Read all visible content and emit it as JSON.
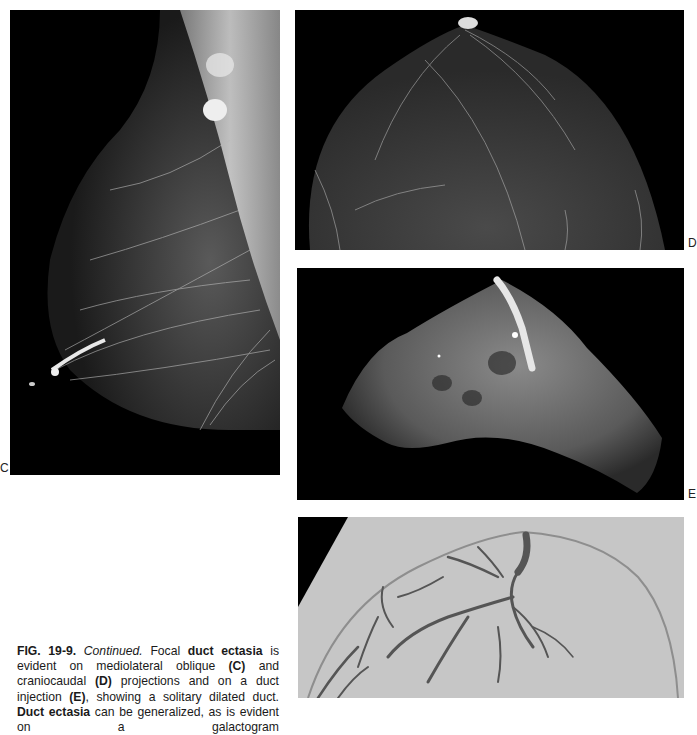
{
  "page": {
    "type": "scanned textbook figure page",
    "background": "#ffffff"
  },
  "panels": [
    {
      "id": "C",
      "label": "C",
      "description": "Mediolateral oblique mammogram showing focal duct ectasia",
      "bg": "#000000"
    },
    {
      "id": "D",
      "label": "D",
      "description": "Craniocaudal mammogram projection",
      "bg": "#000000"
    },
    {
      "id": "E",
      "label": "E",
      "description": "Duct injection image showing a solitary dilated duct",
      "bg": "#000000"
    },
    {
      "id": "E2",
      "label": "",
      "description": "Galactogram showing branching dilated ducts",
      "bg": "#c4c4c4"
    }
  ],
  "labels": {
    "c": "C",
    "d": "D",
    "e": "E"
  },
  "caption": {
    "fig_number": "FIG. 19-9.",
    "continued": "Continued.",
    "seg1": " Focal ",
    "term1": "duct ectasia",
    "seg2": " is evident on mediolateral oblique ",
    "ref_c": "(C)",
    "seg3": " and craniocaudal ",
    "ref_d": "(D)",
    "seg4": " projections and on a duct injection ",
    "ref_e": "(E)",
    "seg5": ", showing a solitary dilated duct. ",
    "term2": "Duct ectasia",
    "seg6": " can be generalized, as is evident on a galactogram"
  }
}
